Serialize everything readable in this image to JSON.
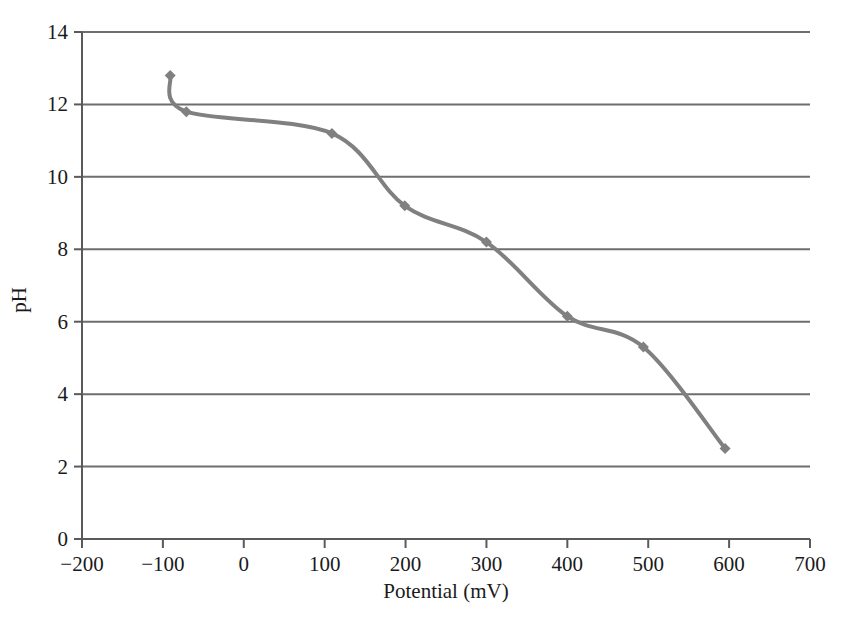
{
  "chart_data": {
    "type": "line",
    "title": "",
    "xlabel": "Potential (mV)",
    "ylabel": "pH",
    "xlim": [
      -200,
      700
    ],
    "ylim": [
      0,
      14
    ],
    "xticks": [
      -200,
      -100,
      0,
      100,
      200,
      300,
      400,
      500,
      600,
      700
    ],
    "xtick_labels": [
      "−200",
      "−100",
      "0",
      "100",
      "200",
      "300",
      "400",
      "500",
      "600",
      "700"
    ],
    "yticks": [
      0,
      2,
      4,
      6,
      8,
      10,
      12,
      14
    ],
    "ytick_labels": [
      "0",
      "2",
      "4",
      "6",
      "8",
      "10",
      "12",
      "14"
    ],
    "grid": "horizontal",
    "legend": "none",
    "series": [
      {
        "name": "pH vs Potential",
        "color": "#808080",
        "marker": "diamond",
        "line_width": 4,
        "x": [
          -91,
          -71,
          109,
          199,
          300,
          400,
          494,
          595
        ],
        "y": [
          12.8,
          11.8,
          11.2,
          9.2,
          8.2,
          6.15,
          5.3,
          2.5
        ]
      }
    ],
    "axis_color": "#5a5a5a",
    "grid_color": "#6e6e6e",
    "background": "#ffffff"
  }
}
